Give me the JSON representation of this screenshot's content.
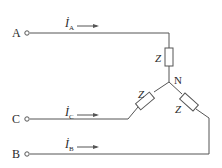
{
  "diagram": {
    "type": "three-phase-star-load",
    "terminals": [
      {
        "id": "A",
        "label": "A"
      },
      {
        "id": "C",
        "label": "C"
      },
      {
        "id": "B",
        "label": "B"
      }
    ],
    "currents": [
      {
        "id": "iA",
        "symbol": "İ",
        "subscript": "A",
        "direction": "right"
      },
      {
        "id": "iC",
        "symbol": "İ",
        "subscript": "C",
        "direction": "right"
      },
      {
        "id": "iB",
        "symbol": "İ",
        "subscript": "B",
        "direction": "right"
      }
    ],
    "impedances": [
      {
        "id": "zA",
        "label": "Z"
      },
      {
        "id": "zC",
        "label": "Z"
      },
      {
        "id": "zB",
        "label": "Z"
      }
    ],
    "neutral": {
      "label": "N"
    },
    "colors": {
      "line": "#555555",
      "text": "#2a2a2a",
      "background": "#ffffff"
    }
  }
}
